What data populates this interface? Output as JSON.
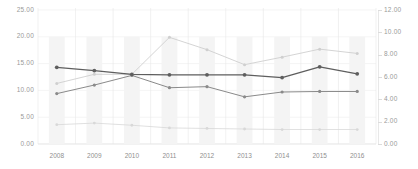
{
  "chart_data": {
    "type": "line",
    "title": "",
    "subtitle": "",
    "xlabel": "",
    "ylabel": "",
    "grid": true,
    "legend": "none",
    "categories": [
      "2008",
      "2009",
      "2010",
      "2011",
      "2012",
      "2013",
      "2014",
      "2015",
      "2016"
    ],
    "x": [
      2008,
      2009,
      2010,
      2011,
      2012,
      2013,
      2014,
      2015,
      2016
    ],
    "left_axis": {
      "min": 0,
      "max": 25,
      "step": 5,
      "ticks": [
        "0.00",
        "5.00",
        "10.00",
        "15.00",
        "20.00",
        "25.00"
      ],
      "tick_values": [
        0,
        5,
        10,
        15,
        20,
        25
      ]
    },
    "right_axis": {
      "min": 0,
      "max": 12,
      "step": 2,
      "ticks": [
        "0.00",
        "2.00",
        "4.00",
        "6.00",
        "8.00",
        "10.00",
        "12.00"
      ],
      "tick_values": [
        0,
        2,
        4,
        6,
        8,
        10,
        12
      ]
    },
    "bars": {
      "name": "background-bars",
      "axis": "left",
      "color": "#f4f4f4",
      "values": [
        20.0,
        20.0,
        20.0,
        20.0,
        20.0,
        20.0,
        20.0,
        20.0,
        20.0
      ]
    },
    "series": [
      {
        "name": "series-1",
        "axis": "left",
        "color": "#5e5e5e",
        "values": [
          14.3,
          13.7,
          13.0,
          12.9,
          12.9,
          12.9,
          12.4,
          14.4,
          13.1
        ]
      },
      {
        "name": "series-2",
        "axis": "left",
        "color": "#8a8a8a",
        "values": [
          9.4,
          11.0,
          12.8,
          10.5,
          10.7,
          8.8,
          9.7,
          9.8,
          9.8
        ]
      },
      {
        "name": "series-3",
        "axis": "left",
        "color": "#cfcfcf",
        "values": [
          11.3,
          13.0,
          13.0,
          19.9,
          17.6,
          14.8,
          16.2,
          17.7,
          16.9
        ]
      },
      {
        "name": "series-4",
        "axis": "left",
        "color": "#d8d8d8",
        "values": [
          3.6,
          3.9,
          3.5,
          3.0,
          2.9,
          2.8,
          2.7,
          2.7,
          2.7
        ]
      }
    ]
  },
  "left_axis_labels": [
    "25.00",
    "20.00",
    "15.00",
    "10.00",
    "5.00",
    "0.00"
  ],
  "right_axis_labels": [
    "12.00",
    "10.00",
    "8.00",
    "6.00",
    "4.00",
    "2.00",
    "0.00"
  ],
  "x_axis_labels": [
    "2008",
    "2009",
    "2010",
    "2011",
    "2012",
    "2013",
    "2014",
    "2015",
    "2016"
  ]
}
